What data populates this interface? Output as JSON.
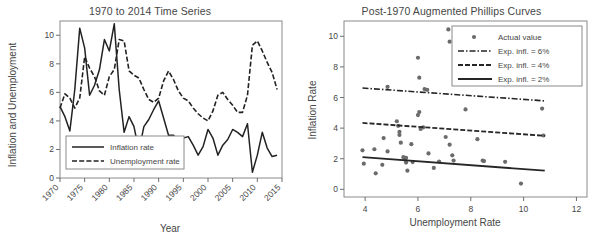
{
  "figure": {
    "background": "#ffffff",
    "ink": "#333333"
  },
  "chart_data": [
    {
      "type": "line",
      "panel": "left",
      "title": "1970 to 2014 Time Series",
      "xlabel": "Year",
      "ylabel": "Inflation and Unemployment",
      "xlim": [
        1970,
        2015
      ],
      "ylim": [
        0,
        11
      ],
      "xticks": [
        "1970",
        "1975",
        "1980",
        "1985",
        "1990",
        "1995",
        "2000",
        "2005",
        "2010",
        "2015"
      ],
      "xtick_values": [
        1970,
        1975,
        1980,
        1985,
        1990,
        1995,
        2000,
        2005,
        2010,
        2015
      ],
      "yticks": [
        "0",
        "2",
        "4",
        "6",
        "8",
        "10"
      ],
      "ytick_values": [
        0,
        2,
        4,
        6,
        8,
        10
      ],
      "xtick_rotation": 45,
      "grid": false,
      "legend_position": "lower-left",
      "x": [
        1970,
        1971,
        1972,
        1973,
        1974,
        1975,
        1976,
        1977,
        1978,
        1979,
        1980,
        1981,
        1982,
        1983,
        1984,
        1985,
        1986,
        1987,
        1988,
        1989,
        1990,
        1991,
        1992,
        1993,
        1994,
        1995,
        1996,
        1997,
        1998,
        1999,
        2000,
        2001,
        2002,
        2003,
        2004,
        2005,
        2006,
        2007,
        2008,
        2009,
        2010,
        2011,
        2012,
        2013,
        2014
      ],
      "series": [
        {
          "name": "Inflation rate",
          "style": "solid",
          "values": [
            5.0,
            4.3,
            3.3,
            6.2,
            10.5,
            9.1,
            5.8,
            6.5,
            7.6,
            9.7,
            8.9,
            10.8,
            6.2,
            3.2,
            4.3,
            3.6,
            1.9,
            3.6,
            4.1,
            4.8,
            5.4,
            4.2,
            3.0,
            3.0,
            2.6,
            2.8,
            2.9,
            2.3,
            1.6,
            2.2,
            3.4,
            2.8,
            1.6,
            2.3,
            2.7,
            3.4,
            3.2,
            2.9,
            3.8,
            0.4,
            1.6,
            3.2,
            2.1,
            1.5,
            1.6
          ]
        },
        {
          "name": "Unemployment rate",
          "style": "dashed",
          "values": [
            4.9,
            5.9,
            5.6,
            4.9,
            5.6,
            8.5,
            7.7,
            7.1,
            6.1,
            5.8,
            7.1,
            7.6,
            9.7,
            9.6,
            7.5,
            7.2,
            7.0,
            6.2,
            5.5,
            5.3,
            5.6,
            6.8,
            7.5,
            6.9,
            6.1,
            5.6,
            5.4,
            4.9,
            4.5,
            4.2,
            4.0,
            4.7,
            5.8,
            6.0,
            5.5,
            5.1,
            4.6,
            4.6,
            5.8,
            9.3,
            9.6,
            8.9,
            8.1,
            7.4,
            6.2
          ]
        }
      ],
      "legend": [
        {
          "label": "Inflation rate",
          "style": "solid"
        },
        {
          "label": "Unemployment rate",
          "style": "dashed"
        }
      ]
    },
    {
      "type": "scatter",
      "panel": "right",
      "title": "Post-1970 Augmented Phillips Curves",
      "xlabel": "Unemployment Rate",
      "ylabel": "Inflation Rate",
      "xlim": [
        3.2,
        12.4
      ],
      "ylim": [
        -0.5,
        11
      ],
      "xticks": [
        "4",
        "6",
        "8",
        "10",
        "12"
      ],
      "xtick_values": [
        4,
        6,
        8,
        10,
        12
      ],
      "yticks": [
        "0",
        "2",
        "4",
        "6",
        "8",
        "10"
      ],
      "ytick_values": [
        0,
        2,
        4,
        6,
        8,
        10
      ],
      "grid": false,
      "legend_position": "upper-right",
      "points": [
        [
          3.9,
          2.55
        ],
        [
          3.95,
          1.68
        ],
        [
          4.35,
          2.62
        ],
        [
          4.4,
          1.05
        ],
        [
          4.65,
          1.6
        ],
        [
          4.85,
          6.7
        ],
        [
          4.85,
          2.48
        ],
        [
          4.7,
          3.35
        ],
        [
          5.2,
          4.45
        ],
        [
          5.25,
          4.15
        ],
        [
          5.3,
          3.75
        ],
        [
          5.3,
          3.55
        ],
        [
          5.35,
          3.05
        ],
        [
          5.45,
          2.1
        ],
        [
          5.5,
          1.95
        ],
        [
          5.55,
          2.05
        ],
        [
          5.55,
          1.75
        ],
        [
          5.6,
          1.22
        ],
        [
          5.75,
          2.95
        ],
        [
          5.8,
          1.78
        ],
        [
          6.0,
          8.6
        ],
        [
          6.05,
          7.3
        ],
        [
          6.05,
          5.05
        ],
        [
          6.0,
          4.85
        ],
        [
          6.1,
          3.95
        ],
        [
          6.2,
          4.05
        ],
        [
          6.25,
          6.55
        ],
        [
          6.35,
          6.5
        ],
        [
          6.4,
          2.35
        ],
        [
          6.6,
          1.4
        ],
        [
          6.8,
          1.82
        ],
        [
          7.05,
          3.42
        ],
        [
          7.15,
          10.45
        ],
        [
          7.2,
          9.65
        ],
        [
          7.2,
          2.92
        ],
        [
          7.3,
          2.22
        ],
        [
          7.35,
          1.88
        ],
        [
          7.8,
          5.22
        ],
        [
          8.2,
          7.4
        ],
        [
          8.25,
          3.28
        ],
        [
          8.45,
          1.88
        ],
        [
          8.5,
          1.85
        ],
        [
          9.3,
          1.8
        ],
        [
          9.9,
          0.38
        ],
        [
          10.7,
          5.28
        ],
        [
          10.75,
          3.52
        ]
      ],
      "fit_lines": [
        {
          "label": "Exp. infl. = 6%",
          "style": "dashdot",
          "x": [
            3.9,
            10.8
          ],
          "y": [
            6.62,
            5.78
          ]
        },
        {
          "label": "Exp. infl. = 4%",
          "style": "dashed",
          "x": [
            3.9,
            10.8
          ],
          "y": [
            4.34,
            3.5
          ]
        },
        {
          "label": "Exp. infl. = 2%",
          "style": "solid",
          "x": [
            3.9,
            10.8
          ],
          "y": [
            2.1,
            1.22
          ]
        }
      ],
      "legend": [
        {
          "label": "Actual value",
          "style": "marker"
        },
        {
          "label": "Exp. infl. = 6%",
          "style": "dashdot"
        },
        {
          "label": "Exp. infl. = 4%",
          "style": "dashed"
        },
        {
          "label": "Exp. infl. = 2%",
          "style": "solid"
        }
      ]
    }
  ]
}
